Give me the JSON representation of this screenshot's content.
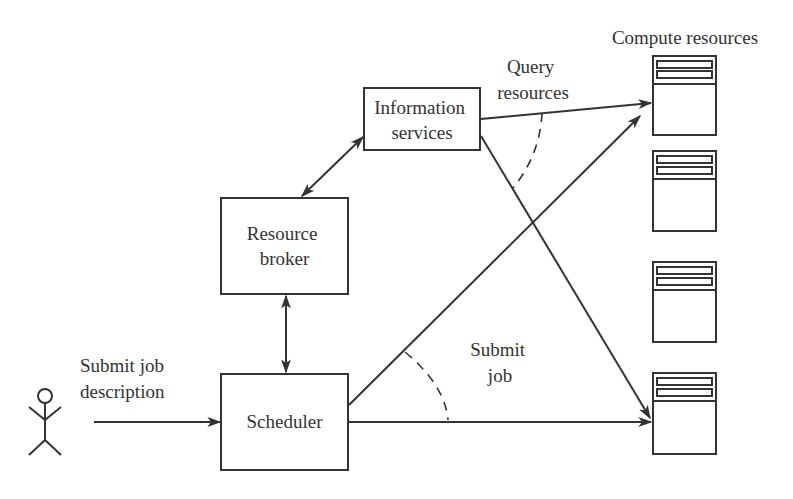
{
  "diagram": {
    "nodes": {
      "information_services": {
        "line1": "Information",
        "line2": "services"
      },
      "resource_broker": {
        "line1": "Resource",
        "line2": "broker"
      },
      "scheduler": {
        "label": "Scheduler"
      },
      "compute_resources": {
        "label": "Compute resources",
        "count": 4
      },
      "user": {
        "label": ""
      }
    },
    "edges": {
      "submit_job_description": {
        "line1": "Submit job",
        "line2": "description"
      },
      "query_resources": {
        "line1": "Query",
        "line2": "resources"
      },
      "submit_job": {
        "line1": "Submit",
        "line2": "job"
      }
    },
    "colors": {
      "stroke": "#333333",
      "background": "#ffffff"
    }
  }
}
